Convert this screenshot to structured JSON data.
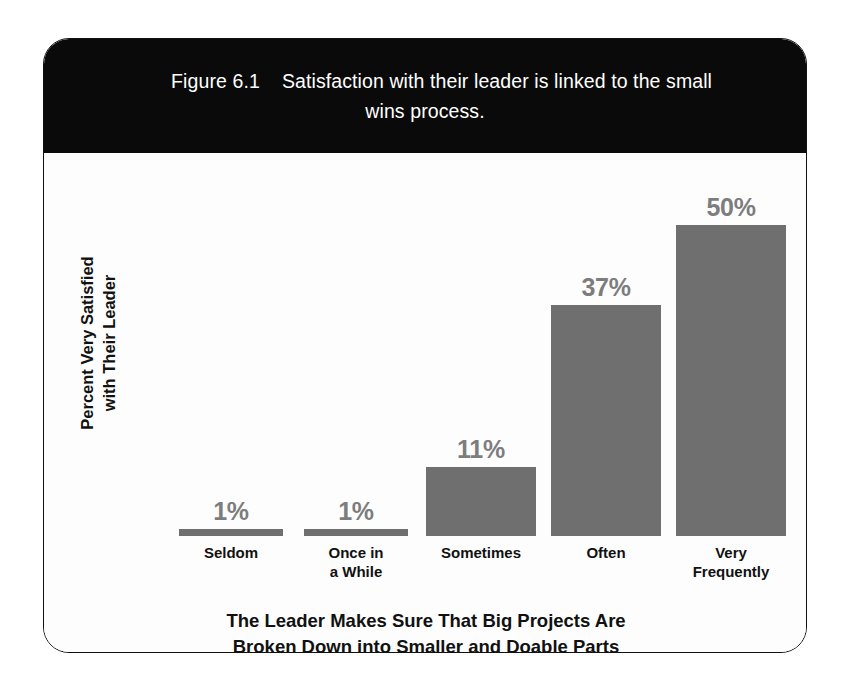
{
  "figure": {
    "number": "Figure 6.1",
    "caption": "Satisfaction with their leader is linked to the small\nwins process.",
    "frame_border_color": "#111111",
    "header_background": "#0a0a0a",
    "header_text_color": "#ffffff"
  },
  "chart_data": {
    "type": "bar",
    "categories": [
      "Seldom",
      "Once in\na While",
      "Sometimes",
      "Often",
      "Very\nFrequently"
    ],
    "values": [
      1,
      1,
      11,
      37,
      50
    ],
    "value_labels": [
      "1%",
      "1%",
      "11%",
      "37%",
      "50%"
    ],
    "xlabel": "The Leader Makes Sure That Big Projects Are\nBroken Down into Smaller and Doable Parts",
    "ylabel": "Percent Very Satisfied\nwith Their Leader",
    "ylim": [
      0,
      55
    ],
    "grid": false,
    "legend": false,
    "bar_color": "#6f6f6f",
    "value_label_color": "#7d7d7d",
    "axis_text_color": "#111111"
  }
}
